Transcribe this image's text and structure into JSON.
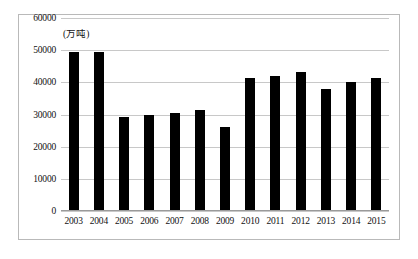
{
  "chart_data": {
    "type": "bar",
    "title": "",
    "xlabel": "",
    "ylabel": "",
    "unit_label": "(万吨)",
    "ylim": [
      0,
      60000
    ],
    "ytick_step": 10000,
    "yticks": [
      "0",
      "10000",
      "20000",
      "30000",
      "40000",
      "50000",
      "60000"
    ],
    "grid": true,
    "legend": "none",
    "bar_color": "#000000",
    "gridline_color": "#c8c8c8",
    "categories": [
      "2003",
      "2004",
      "2005",
      "2006",
      "2007",
      "2008",
      "2009",
      "2010",
      "2011",
      "2012",
      "2013",
      "2014",
      "2015"
    ],
    "values": [
      49500,
      49300,
      29300,
      29800,
      30500,
      31400,
      26000,
      41300,
      42000,
      43200,
      37800,
      40200,
      41300
    ]
  }
}
